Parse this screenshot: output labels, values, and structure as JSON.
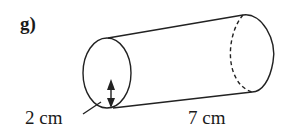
{
  "figure": {
    "part_label": "g)",
    "shape": "cylinder",
    "radius_label": "2 cm",
    "length_label": "7 cm",
    "stroke_color": "#222222"
  }
}
